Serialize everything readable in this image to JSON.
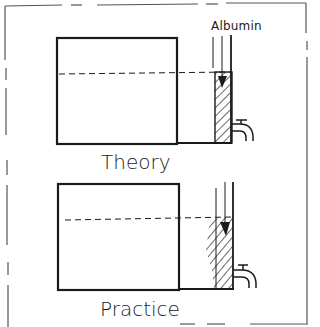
{
  "figure": {
    "panels": [
      {
        "id": "theory",
        "label": "Theory",
        "annotation": "Albumin",
        "description": "Tank with albumin layer settled as a narrow, even column next to the outlet tap"
      },
      {
        "id": "practice",
        "label": "Practice",
        "annotation": "",
        "description": "Tank with albumin layer spread wider and unevenly next to the outlet tap"
      }
    ],
    "colors": {
      "line": "#1a1a1a",
      "background": "#ffffff"
    }
  }
}
